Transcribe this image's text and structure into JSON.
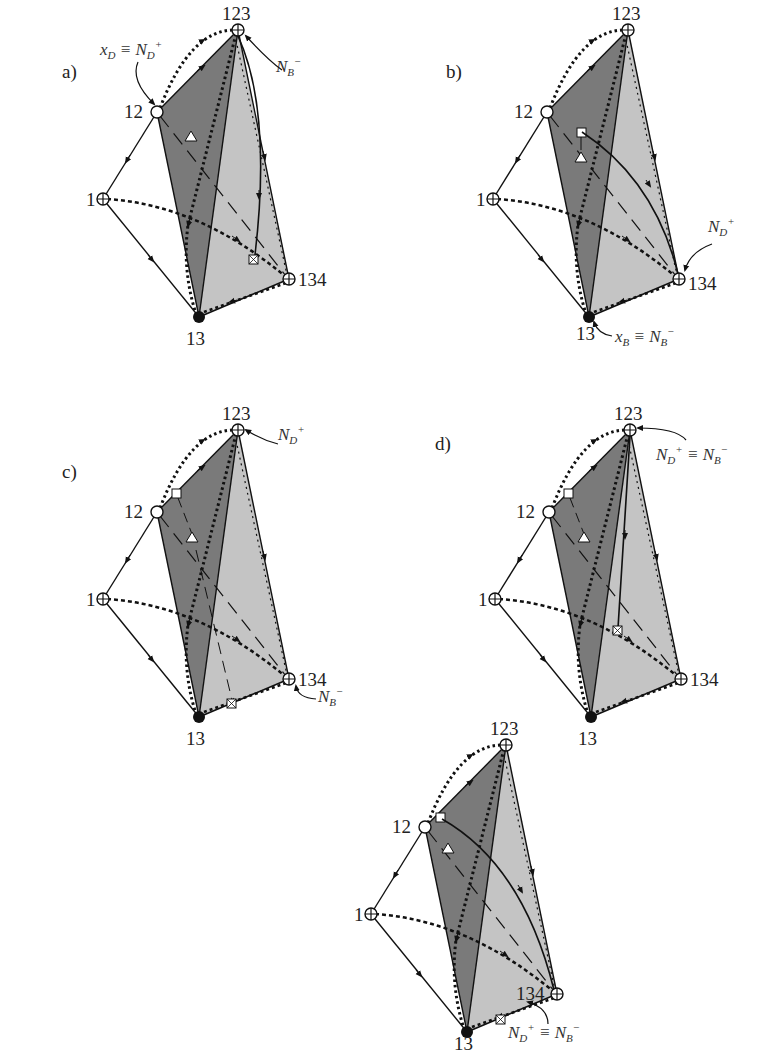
{
  "figure": {
    "vertex_labels": {
      "v1": "1",
      "v12": "12",
      "v13": "13",
      "v123": "123",
      "v134": "134"
    },
    "colors": {
      "dark_face": "#7a7a7a",
      "light_face": "#c4c4c4",
      "stroke": "#111111"
    },
    "panels": [
      {
        "id": "a",
        "label": "a)",
        "annotations": [
          {
            "text": "x_D ≡ N_D^+",
            "main": "x",
            "sub": "D",
            "rest": " ≡ N",
            "sub2": "D",
            "sup2": "+",
            "target": "12"
          },
          {
            "text": "N_B^-",
            "main": "N",
            "sub": "B",
            "sup": "−",
            "target": "123"
          }
        ]
      },
      {
        "id": "b",
        "label": "b)",
        "annotations": [
          {
            "text": "N_D^+",
            "main": "N",
            "sub": "D",
            "sup": "+",
            "target": "134"
          },
          {
            "text": "x_B ≡ N_B^-",
            "main": "x",
            "sub": "B",
            "rest": " ≡ N",
            "sub2": "B",
            "sup2": "−",
            "target": "13"
          }
        ]
      },
      {
        "id": "c",
        "label": "c)",
        "annotations": [
          {
            "text": "N_D^+",
            "main": "N",
            "sub": "D",
            "sup": "+",
            "target": "123"
          },
          {
            "text": "N_B^-",
            "main": "N",
            "sub": "B",
            "sup": "−",
            "target": "134"
          }
        ]
      },
      {
        "id": "d",
        "label": "d)",
        "annotations": [
          {
            "text": "N_D^+ ≡ N_B^-",
            "main": "N",
            "sub": "D",
            "sup": "+",
            "rest": " ≡ N",
            "sub2": "B",
            "sup2": "−",
            "target": "123"
          }
        ]
      },
      {
        "id": "e",
        "label": "",
        "annotations": [
          {
            "text": "N_D^+ ≡ N_B^-",
            "main": "N",
            "sub": "D",
            "sup": "+",
            "rest": " ≡ N",
            "sub2": "B",
            "sup2": "−",
            "target": "134"
          }
        ]
      }
    ]
  }
}
